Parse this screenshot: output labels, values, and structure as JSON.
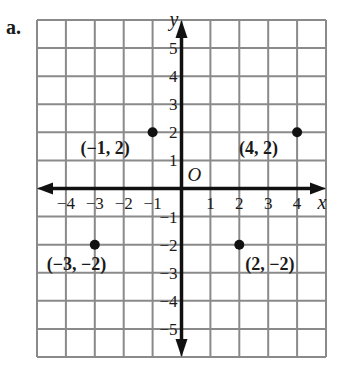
{
  "part_label": "a.",
  "chart_data": {
    "type": "scatter",
    "title": "",
    "xlabel": "x",
    "ylabel": "y",
    "origin_label": "O",
    "xlim": [
      -5,
      5
    ],
    "ylim": [
      -6,
      6
    ],
    "grid": true,
    "x_ticks": [
      -4,
      -3,
      -2,
      -1,
      1,
      2,
      3,
      4
    ],
    "x_tick_labels": [
      "−4",
      "−3",
      "−2",
      "−1",
      "1",
      "2",
      "3",
      "4"
    ],
    "y_ticks": [
      5,
      4,
      3,
      2,
      1,
      -1,
      -2,
      -3,
      -4,
      -5
    ],
    "y_tick_labels": [
      "5",
      "4",
      "3",
      "2",
      "1",
      "−1",
      "−2",
      "−3",
      "−4",
      "−5"
    ],
    "points": [
      {
        "x": -1,
        "y": 2,
        "label": "(−1, 2)"
      },
      {
        "x": 4,
        "y": 2,
        "label": "(4, 2)"
      },
      {
        "x": -3,
        "y": -2,
        "label": "(−3, −2)"
      },
      {
        "x": 2,
        "y": -2,
        "label": "(2, −2)"
      }
    ]
  },
  "colors": {
    "grid": "#8a8a8a",
    "axis": "#111111",
    "point": "#111111",
    "text": "#1a1a1a"
  }
}
